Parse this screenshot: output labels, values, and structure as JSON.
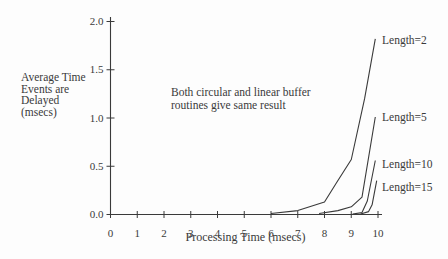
{
  "figure": {
    "background": "#fdfdfd",
    "ink": "#3a3a3a"
  },
  "chart_data": {
    "type": "line",
    "title": "",
    "xlabel": "Processing Time (msecs)",
    "ylabel": "Average Time\nEvents are\nDelayed\n(msecs)",
    "annotation": "Both circular and linear buffer\nroutines give same result",
    "xlim": [
      0,
      10
    ],
    "ylim": [
      0,
      2.0
    ],
    "grid": false,
    "legend_position": "labels-at-curve-tips-right",
    "x_ticks": [
      {
        "value": 0,
        "label": "0"
      },
      {
        "value": 1,
        "label": "1"
      },
      {
        "value": 2,
        "label": "2"
      },
      {
        "value": 3,
        "label": "3"
      },
      {
        "value": 4,
        "label": "4"
      },
      {
        "value": 5,
        "label": "5"
      },
      {
        "value": 6,
        "label": "6"
      },
      {
        "value": 7,
        "label": "7"
      },
      {
        "value": 8,
        "label": "8"
      },
      {
        "value": 9,
        "label": "9"
      },
      {
        "value": 10,
        "label": "10"
      }
    ],
    "y_ticks": [
      {
        "value": 0.0,
        "label": "0.0"
      },
      {
        "value": 0.5,
        "label": "0.5"
      },
      {
        "value": 1.0,
        "label": "1.0"
      },
      {
        "value": 1.5,
        "label": "1.5"
      },
      {
        "value": 2.0,
        "label": "2.0"
      }
    ],
    "series": [
      {
        "name": "Length=2",
        "points": [
          [
            6,
            0.01
          ],
          [
            7,
            0.04
          ],
          [
            8,
            0.13
          ],
          [
            8.45,
            0.33
          ],
          [
            9,
            0.57
          ],
          [
            9.5,
            1.2
          ],
          [
            9.9,
            1.82
          ]
        ]
      },
      {
        "name": "Length=5",
        "points": [
          [
            7.8,
            0.01
          ],
          [
            8.5,
            0.04
          ],
          [
            9,
            0.08
          ],
          [
            9.4,
            0.18
          ],
          [
            9.9,
            1.01
          ]
        ]
      },
      {
        "name": "Length=10",
        "points": [
          [
            9.05,
            0.005
          ],
          [
            9.4,
            0.02
          ],
          [
            9.6,
            0.14
          ],
          [
            9.9,
            0.56
          ]
        ]
      },
      {
        "name": "Length=15",
        "points": [
          [
            9.35,
            0.005
          ],
          [
            9.65,
            0.03
          ],
          [
            9.78,
            0.1
          ],
          [
            9.95,
            0.35
          ]
        ]
      }
    ]
  }
}
